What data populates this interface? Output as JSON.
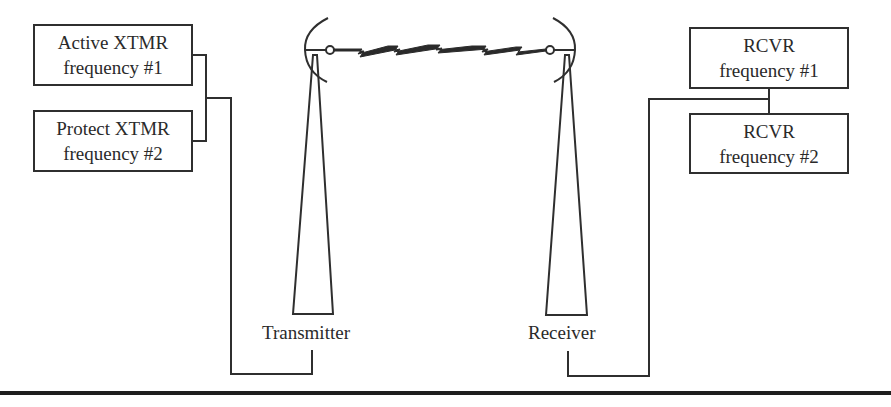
{
  "diagram": {
    "type": "frequency diversity microwave radio link",
    "transmit_side": {
      "boxes": [
        {
          "line1": "Active XTMR",
          "line2": "frequency #1"
        },
        {
          "line1": "Protect XTMR",
          "line2": "frequency #2"
        }
      ],
      "antenna_label": "Transmitter"
    },
    "receive_side": {
      "boxes": [
        {
          "line1": "RCVR",
          "line2": "frequency #1"
        },
        {
          "line1": "RCVR",
          "line2": "frequency #2"
        }
      ],
      "antenna_label": "Receiver"
    },
    "link": "radio-path-zigzag",
    "colors": {
      "line": "#2f2f2f",
      "background": "#ffffff",
      "rule": "#1e1e1e"
    }
  }
}
